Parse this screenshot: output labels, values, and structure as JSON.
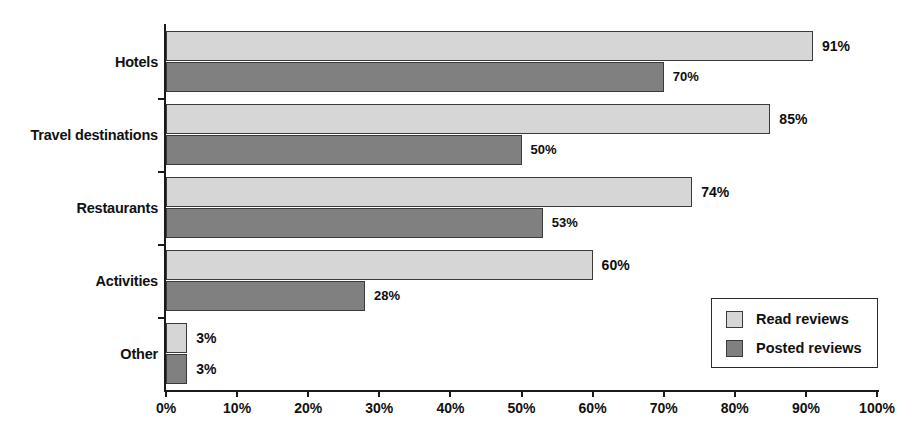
{
  "chart_data": {
    "type": "bar",
    "orientation": "horizontal",
    "title": "",
    "xlabel": "",
    "ylabel": "",
    "xlim": [
      0,
      100
    ],
    "xunit": "%",
    "grid": false,
    "legend_position": "bottom-right",
    "categories": [
      "Hotels",
      "Travel destinations",
      "Restaurants",
      "Activities",
      "Other"
    ],
    "series": [
      {
        "name": "Read reviews",
        "color": "#d6d6d6",
        "values": [
          91,
          85,
          74,
          60,
          3
        ],
        "labels": [
          "91%",
          "85%",
          "74%",
          "60%",
          "3%"
        ]
      },
      {
        "name": "Posted reviews",
        "color": "#808080",
        "values": [
          70,
          50,
          53,
          28,
          3
        ],
        "labels": [
          "70%",
          "50%",
          "53%",
          "28%",
          "3%"
        ]
      }
    ],
    "xticks": [
      0,
      10,
      20,
      30,
      40,
      50,
      60,
      70,
      80,
      90,
      100
    ],
    "xticklabels": [
      "0%",
      "10%",
      "20%",
      "30%",
      "40%",
      "50%",
      "60%",
      "70%",
      "80%",
      "90%",
      "100%"
    ]
  },
  "legend": {
    "entries": [
      {
        "label": "Read reviews",
        "swatch": "read"
      },
      {
        "label": "Posted reviews",
        "swatch": "posted"
      }
    ]
  }
}
